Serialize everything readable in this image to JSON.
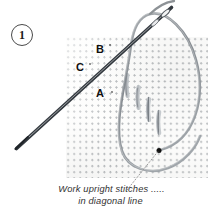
{
  "figure": {
    "step_number": "1",
    "technique": "upright stitches in diagonal line",
    "background_color": "#ffffff"
  },
  "step_badge": {
    "label": "1",
    "shape": "circle",
    "border_color": "#4a4a4a"
  },
  "fabric": {
    "name": "aida-cloth",
    "color": "#fdfdfc",
    "weave_dot_color": "#787e84",
    "x": 66,
    "y": 37,
    "width": 142,
    "height": 141
  },
  "point_labels": [
    {
      "id": "B",
      "label": "B",
      "x": 96,
      "y": 44
    },
    {
      "id": "C",
      "label": "C",
      "x": 76,
      "y": 62
    },
    {
      "id": "A",
      "label": "A",
      "x": 96,
      "y": 88
    }
  ],
  "needle": {
    "name": "sewing-needle",
    "color": "#6e7478",
    "eye_end": {
      "x": 172,
      "y": 8
    },
    "tip_end": {
      "x": 16,
      "y": 149
    }
  },
  "thread": {
    "name": "embroidery-thread",
    "color": "#8d9296",
    "exit_point": {
      "x": 159,
      "y": 150
    }
  },
  "exit_dot": {
    "name": "thread-exit-point",
    "color": "#111111",
    "x": 159,
    "y": 150
  },
  "stitches": {
    "name": "upright-stitches",
    "count": 4,
    "color": "#8a9096",
    "arrangement": "diagonal line",
    "items": [
      {
        "x1": 127,
        "y1": 76,
        "x2": 127,
        "y2": 96
      },
      {
        "x1": 138,
        "y1": 88,
        "x2": 138,
        "y2": 108
      },
      {
        "x1": 148,
        "y1": 100,
        "x2": 148,
        "y2": 120
      },
      {
        "x1": 159,
        "y1": 112,
        "x2": 159,
        "y2": 132
      }
    ]
  },
  "leader_line": {
    "name": "dotted-leader",
    "style": "dotted",
    "color": "#9a9a9a",
    "from": {
      "x": 128,
      "y": 190
    },
    "to": {
      "x": 158,
      "y": 151
    }
  },
  "caption": {
    "line_1": "Work upright stitches .....",
    "line_2": "in diagonal line",
    "color": "#333333"
  }
}
